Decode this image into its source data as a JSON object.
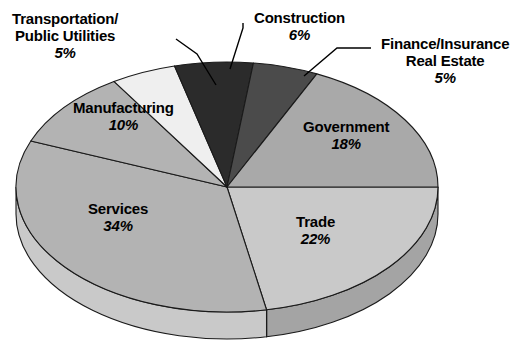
{
  "chart_data": {
    "type": "pie",
    "title": "",
    "subtitle": "",
    "xlabel": "",
    "ylabel": "",
    "legend_position": "none",
    "grid": false,
    "units": "percent",
    "total": 100,
    "style": "3d-exploded-none",
    "categories": [
      "Trade",
      "Services",
      "Manufacturing",
      "Transportation/Public Utilities",
      "Construction",
      "Finance/Insurance Real Estate",
      "Government"
    ],
    "values": [
      22,
      34,
      10,
      5,
      6,
      5,
      18
    ],
    "slices": [
      {
        "id": "trade",
        "label": "Trade",
        "label_line1": "Trade",
        "label_line2": "",
        "value": 22,
        "pct_text": "22%",
        "color": "#c9c9c9",
        "side_color": "#a4a4a4",
        "start_deg": 0,
        "end_deg": 79.2,
        "label_placement": "inside",
        "label_x": 296,
        "label_y": 213,
        "align": "ctr"
      },
      {
        "id": "services",
        "label": "Services",
        "label_line1": "Services",
        "label_line2": "",
        "value": 34,
        "pct_text": "34%",
        "color": "#b3b3b3",
        "side_color": "#c9c9c9",
        "start_deg": 79.2,
        "end_deg": 201.6,
        "label_placement": "inside",
        "label_x": 88,
        "label_y": 200,
        "align": "ctr"
      },
      {
        "id": "manufacturing",
        "label": "Manufacturing",
        "label_line1": "Manufacturing",
        "label_line2": "",
        "value": 10,
        "pct_text": "10%",
        "color": "#b3b3b3",
        "side_color": "#b3b3b3",
        "start_deg": 201.6,
        "end_deg": 237.6,
        "label_placement": "inside",
        "label_x": 73,
        "label_y": 99,
        "align": "ctr"
      },
      {
        "id": "transportation",
        "label": "Transportation/Public Utilities",
        "label_line1": "Transportation/",
        "label_line2": "Public Utilities",
        "value": 5,
        "pct_text": "5%",
        "color": "#efefef",
        "side_color": "#efefef",
        "start_deg": 237.6,
        "end_deg": 255.6,
        "label_placement": "outside",
        "label_x": 12,
        "label_y": 10,
        "align": "ctr"
      },
      {
        "id": "construction",
        "label": "Construction",
        "label_line1": "Construction",
        "label_line2": "",
        "value": 6,
        "pct_text": "6%",
        "color": "#2b2b2b",
        "side_color": "#2b2b2b",
        "start_deg": 255.6,
        "end_deg": 277.2,
        "label_placement": "outside",
        "label_x": 254,
        "label_y": 9,
        "align": "ctr"
      },
      {
        "id": "finance",
        "label": "Finance/Insurance Real Estate",
        "label_line1": "Finance/Insurance",
        "label_line2": "Real Estate",
        "value": 5,
        "pct_text": "5%",
        "color": "#4b4b4b",
        "side_color": "#4b4b4b",
        "start_deg": 277.2,
        "end_deg": 295.2,
        "label_placement": "outside",
        "label_x": 381,
        "label_y": 35,
        "align": "ctr"
      },
      {
        "id": "government",
        "label": "Government",
        "label_line1": "Government",
        "label_line2": "",
        "value": 18,
        "pct_text": "18%",
        "color": "#a9a9a9",
        "side_color": "#a9a9a9",
        "start_deg": 295.2,
        "end_deg": 360,
        "label_placement": "inside",
        "label_x": 303,
        "label_y": 118,
        "align": "ctr"
      }
    ],
    "leader_lines": [
      {
        "for": "transportation",
        "points": "176,39 197,54 216,85"
      },
      {
        "for": "construction",
        "points": "243,23 243,28 230,69"
      },
      {
        "for": "finance",
        "points": "371,48 337,48 304,76"
      }
    ],
    "geometry": {
      "center_x": 227,
      "center_y": 187,
      "radius_x": 211,
      "radius_y": 125,
      "depth": 27,
      "outline_color": "#1a1a1a",
      "background": "#ffffff"
    }
  }
}
